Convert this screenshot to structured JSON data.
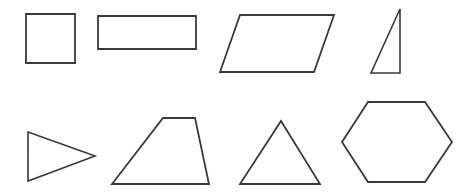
{
  "page": {
    "background_color": "#ffffff",
    "stroke_color": "#3a3a3a",
    "fill_color": "#ffffff",
    "width": 459,
    "height": 192
  },
  "shapes": {
    "row1": [
      {
        "id": "square",
        "label": "Square",
        "sides": 4,
        "points": "26,14 75,14 75,63 26,63"
      },
      {
        "id": "rectangle",
        "label": "Rectangle",
        "sides": 4,
        "points": "98,16 196,16 196,49 98,49"
      },
      {
        "id": "parallelogram",
        "label": "Parallelogram",
        "sides": 4,
        "points": "240,15 334,15 314,72 220,72"
      },
      {
        "id": "right-triangle",
        "label": "Right Triangle",
        "sides": 3,
        "points": "400,9 400,73 371,73"
      }
    ],
    "row2": [
      {
        "id": "right-pointing-triangle",
        "label": "Right-Pointing Triangle",
        "sides": 3,
        "points": "28,132 95,156 28,181"
      },
      {
        "id": "trapezoid",
        "label": "Trapezoid",
        "sides": 4,
        "points": "163,118 195,118 209,184 112,184"
      },
      {
        "id": "isosceles-triangle",
        "label": "Isosceles Triangle",
        "sides": 3,
        "points": "281,121 320,184 240,184"
      },
      {
        "id": "hexagon",
        "label": "Hexagon",
        "sides": 6,
        "points": "368,102 425,102 452,142 425,182 368,182 342,142"
      }
    ]
  }
}
